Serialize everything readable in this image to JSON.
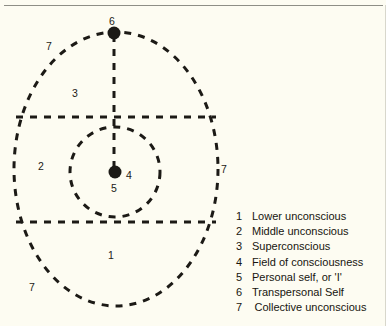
{
  "figure": {
    "background_color": "#fdfcf2",
    "ink_color": "#1c1a16"
  },
  "diagram": {
    "outer_shape": "dashed-ellipse",
    "inner_shape": "dashed-circle",
    "divider_lines": 2,
    "vertical_line": "dashed",
    "labels": [
      {
        "text": "6",
        "x": 114,
        "y": 22,
        "name": "diagram-label-6-transpersonal-self"
      },
      {
        "text": "7",
        "x": 50,
        "y": 47,
        "name": "diagram-label-7-top-left"
      },
      {
        "text": "3",
        "x": 75,
        "y": 92,
        "name": "diagram-label-3-superconscious"
      },
      {
        "text": "2",
        "x": 41,
        "y": 165,
        "name": "diagram-label-2-middle-unconscious"
      },
      {
        "text": "4",
        "x": 128,
        "y": 168,
        "name": "diagram-label-4-field-of-consciousness"
      },
      {
        "text": "5",
        "x": 113,
        "y": 183,
        "name": "diagram-label-5-personal-self"
      },
      {
        "text": "7",
        "x": 222,
        "y": 165,
        "name": "diagram-label-7-right"
      },
      {
        "text": "1",
        "x": 110,
        "y": 252,
        "name": "diagram-label-1-lower-unconscious"
      },
      {
        "text": "7",
        "x": 32,
        "y": 285,
        "name": "diagram-label-7-bottom-left"
      }
    ]
  },
  "legend": {
    "items": [
      {
        "num": "1",
        "label": "Lower unconscious"
      },
      {
        "num": "2",
        "label": "Middle unconscious"
      },
      {
        "num": "3",
        "label": "Superconscious"
      },
      {
        "num": "4",
        "label": "Field of consciousness"
      },
      {
        "num": "5",
        "label": "Personal self, or 'I'"
      },
      {
        "num": "6",
        "label": "Transpersonal Self"
      },
      {
        "num": "7",
        "label": "Collective unconscious"
      }
    ]
  }
}
